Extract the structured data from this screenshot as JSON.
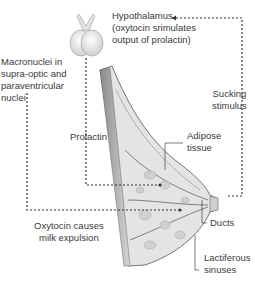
{
  "diagram": {
    "labels": {
      "hypothalamus_line1": "Hypothalamus",
      "hypothalamus_line2": "(oxytocin srimulates",
      "hypothalamus_line3": "output of prolactin)",
      "macronuclei_line1": "Macronuclei in",
      "macronuclei_line2": "supra-optic and",
      "macronuclei_line3": "paraventricular",
      "macronuclei_line4": "nuclei",
      "prolactin": "Prolactin",
      "sucking_line1": "Sucking",
      "sucking_line2": "stimulus",
      "adipose_line1": "Adipose",
      "adipose_line2": "tissue",
      "oxytocin_line1": "Oxytocin causes",
      "oxytocin_line2": "milk expulsion",
      "ducts": "Ducts",
      "lactiferous_line1": "Lactiferous",
      "lactiferous_line2": "sinuses"
    },
    "elements": [
      "pituitary-gland",
      "breast-cross-section",
      "nipple",
      "dotted-pathway-arrows"
    ],
    "colors": {
      "line": "#333333",
      "tissue": "#d9d9d9",
      "gland": "#e6e6e6",
      "text": "#3a3a3a"
    }
  }
}
